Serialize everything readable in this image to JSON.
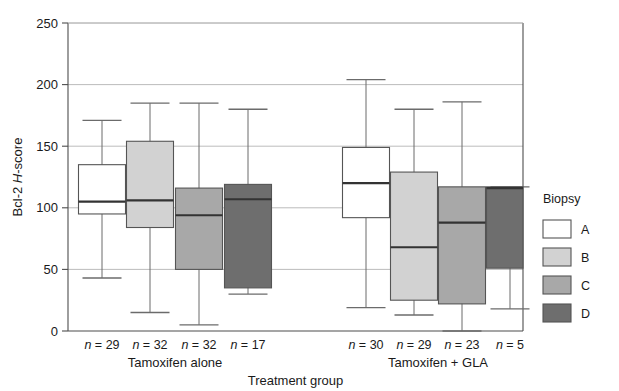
{
  "chart_data": {
    "type": "box",
    "title": "",
    "xlabel": "Treatment group",
    "ylabel_plain": "Bcl-2 ",
    "ylabel_italic": "H",
    "ylabel_tail": "-score",
    "ylim": [
      0,
      250
    ],
    "yticks": [
      0,
      50,
      100,
      150,
      200,
      250
    ],
    "ytick_labels": [
      "0",
      "50",
      "100",
      "150",
      "200",
      "250"
    ],
    "grid": true,
    "legend": {
      "title": "Biopsy",
      "position": "right",
      "entries": [
        {
          "label": "A",
          "color": "#ffffff"
        },
        {
          "label": "B",
          "color": "#d2d2d2"
        },
        {
          "label": "C",
          "color": "#a8a8a8"
        },
        {
          "label": "D",
          "color": "#6e6e6e"
        }
      ]
    },
    "groups": [
      {
        "name": "Tamoxifen alone",
        "boxes": [
          {
            "biopsy": "A",
            "n_label": "n = 29",
            "n": 29,
            "color": "#ffffff",
            "whisker_low": 43,
            "q1": 95,
            "median": 105,
            "q3": 135,
            "whisker_high": 171
          },
          {
            "biopsy": "B",
            "n_label": "n = 32",
            "n": 32,
            "color": "#d2d2d2",
            "whisker_low": 15,
            "q1": 84,
            "median": 106,
            "q3": 154,
            "whisker_high": 185
          },
          {
            "biopsy": "C",
            "n_label": "n = 32",
            "n": 32,
            "color": "#a8a8a8",
            "whisker_low": 5,
            "q1": 50,
            "median": 94,
            "q3": 116,
            "whisker_high": 185
          },
          {
            "biopsy": "D",
            "n_label": "n = 17",
            "n": 17,
            "color": "#6e6e6e",
            "whisker_low": 30,
            "q1": 35,
            "median": 107,
            "q3": 119,
            "whisker_high": 180
          }
        ]
      },
      {
        "name": "Tamoxifen + GLA",
        "boxes": [
          {
            "biopsy": "A",
            "n_label": "n = 30",
            "n": 30,
            "color": "#ffffff",
            "whisker_low": 19,
            "q1": 92,
            "median": 120,
            "q3": 149,
            "whisker_high": 204
          },
          {
            "biopsy": "B",
            "n_label": "n = 29",
            "n": 29,
            "color": "#d2d2d2",
            "whisker_low": 13,
            "q1": 25,
            "median": 68,
            "q3": 129,
            "whisker_high": 180
          },
          {
            "biopsy": "C",
            "n_label": "n = 23",
            "n": 23,
            "color": "#a8a8a8",
            "whisker_low": 0,
            "q1": 22,
            "median": 88,
            "q3": 117,
            "whisker_high": 186
          },
          {
            "biopsy": "D",
            "n_label": "n = 5",
            "n": 5,
            "color": "#6e6e6e",
            "whisker_low": 18,
            "q1": 51,
            "median": 116,
            "q3": 117,
            "whisker_high": 117
          }
        ]
      }
    ]
  },
  "colors": {
    "axis": "#4d4d4d",
    "grid": "#b4b4b4",
    "box_outline": "#555555",
    "median": "#333333",
    "whisker": "#6b6b6b",
    "text": "#1a1a1a"
  }
}
